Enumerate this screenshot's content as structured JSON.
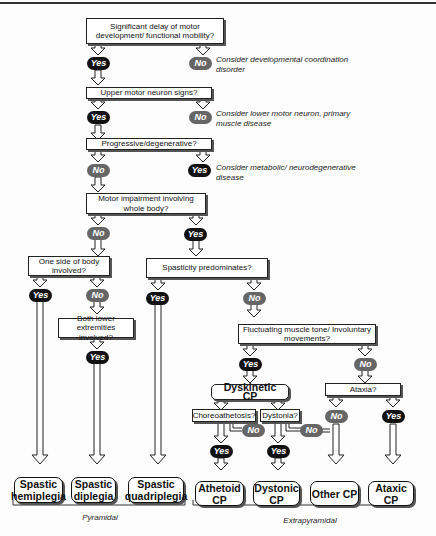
{
  "questions": {
    "q1": "Significant delay of motor development/ functional mobility?",
    "q2": "Upper motor neuron signs?",
    "q3": "Progressive/degenerative?",
    "q4": "Motor impairment involving whole body?",
    "q5": "One side of body involved?",
    "q6": "Both lower extremities involved?",
    "q7": "Spasticity predominates?",
    "q8": "Fluctuating muscle tone/ Involuntary movements?",
    "q9": "Ataxia?",
    "q10": "Choreoathetosis?",
    "q11": "Dystonia?"
  },
  "intermediate": {
    "dyskinetic": "Dyskinetic CP"
  },
  "labels": {
    "yes": "Yes",
    "no": "No"
  },
  "notes": {
    "n1": "Consider developmental coordination disorder",
    "n2": "Consider lower motor neuron, primary muscle disease",
    "n3": "Consider metabolic/ neurodegenerative disease"
  },
  "outcomes": [
    {
      "label": "Spastic hemiplegia"
    },
    {
      "label": "Spastic diplegia"
    },
    {
      "label": "Spastic quadriplegia"
    },
    {
      "label": "Athetoid CP"
    },
    {
      "label": "Dystonic CP"
    },
    {
      "label": "Other CP"
    },
    {
      "label": "Ataxic CP"
    }
  ],
  "groups": {
    "pyramidal": "Pyramidal",
    "extrapyramidal": "Extrapyramidal"
  }
}
